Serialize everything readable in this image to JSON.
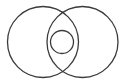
{
  "diagram": {
    "type": "venn",
    "background": "#ffffff",
    "stroke_color": "#3a3a3a",
    "stroke_width": 1.3,
    "shapes": [
      {
        "id": "left-set",
        "kind": "circle",
        "cx": 43,
        "cy": 42,
        "r": 35.5
      },
      {
        "id": "right-set",
        "kind": "circle",
        "cx": 82.5,
        "cy": 42,
        "r": 35.5
      },
      {
        "id": "inner-subset",
        "kind": "circle",
        "cx": 62,
        "cy": 42,
        "r": 11.5
      }
    ],
    "labels": []
  }
}
